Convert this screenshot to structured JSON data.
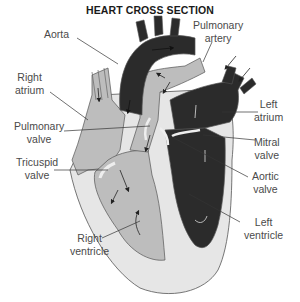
{
  "title": "HEART CROSS SECTION",
  "colors": {
    "oxygenated_side": "#2b2b2b",
    "deoxygenated_side": "#bdbdbd",
    "wall": "#e6e6e6",
    "outline": "#555555",
    "label_text": "#4a4a4a"
  },
  "labels": {
    "aorta": "Aorta",
    "pulmonary_artery": [
      "Pulmonary",
      "artery"
    ],
    "right_atrium": [
      "Right",
      "atrium"
    ],
    "left_atrium": [
      "Left",
      "atrium"
    ],
    "pulmonary_valve": [
      "Pulmonary",
      "valve"
    ],
    "mitral_valve": [
      "Mitral",
      "valve"
    ],
    "tricuspid_valve": [
      "Tricuspid",
      "valve"
    ],
    "aortic_valve": [
      "Aortic",
      "valve"
    ],
    "right_ventricle": [
      "Right",
      "ventricle"
    ],
    "left_ventricle": [
      "Left",
      "ventricle"
    ]
  }
}
